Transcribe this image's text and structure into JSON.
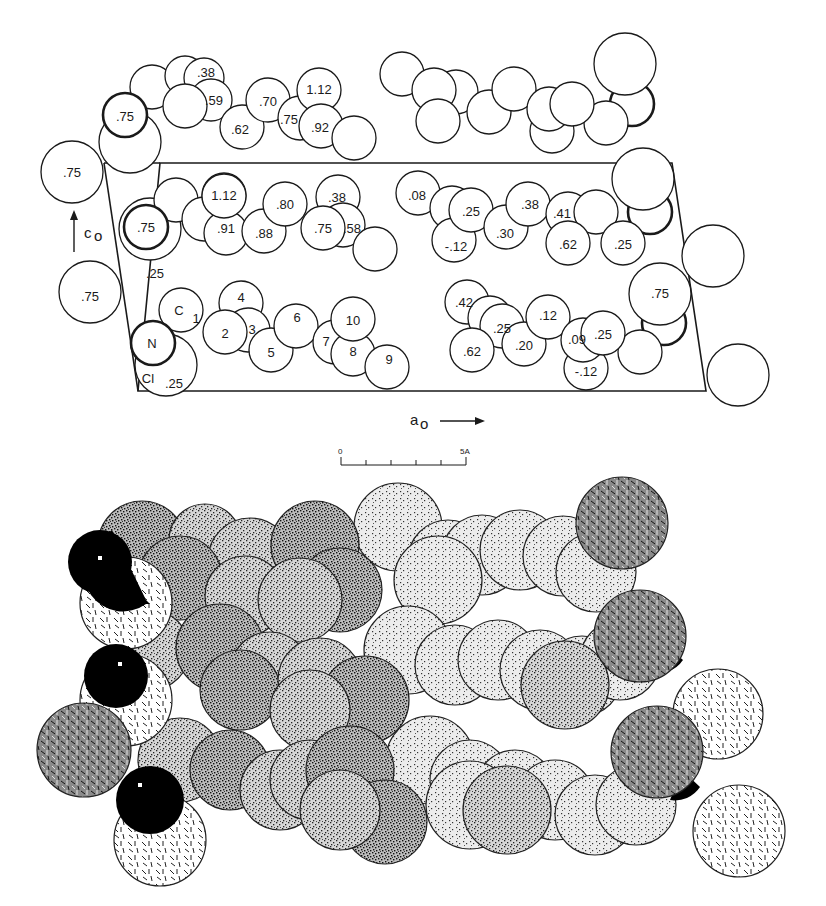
{
  "figure": {
    "top_panel": {
      "description": "Crystal packing projection along b, unit cell outlined",
      "axis_labels": {
        "c_axis": "c",
        "c_sub": "o",
        "a_axis": "a",
        "a_sub": "o"
      },
      "scale_bar": {
        "start_label": "0",
        "end_label": "5A",
        "ticks": 5
      },
      "atom_labels": {
        "outside_left_1": ".75",
        "outside_left_2": ".75",
        "row_top": [
          ".75",
          ".38",
          ".59",
          ".62",
          ".70",
          "1.12",
          ".75",
          ".92"
        ],
        "row_mid_left": [
          ".75",
          ".25",
          "1.12",
          ".91",
          ".88",
          ".80",
          ".38",
          ".75",
          ".58"
        ],
        "row_mid_right": [
          ".08",
          ".25",
          "-.12",
          ".30",
          ".38",
          ".41",
          ".62",
          ".25"
        ],
        "row_bottom_left": [
          "N",
          "Cl",
          ".25",
          "C",
          "1",
          "2",
          "3",
          "4",
          "5",
          "6",
          "7",
          "8",
          "9",
          "10"
        ],
        "row_bottom_right": [
          ".42",
          ".25",
          ".62",
          ".20",
          ".12",
          ".09",
          "-.12",
          ".25",
          ".75"
        ]
      }
    },
    "bottom_panel": {
      "description": "Space-filling model of molecular packing",
      "shading_legend": [
        {
          "pattern": "solid-black",
          "meaning": "N atom"
        },
        {
          "pattern": "dashes",
          "meaning": "Cl atom"
        },
        {
          "pattern": "dense-stipple",
          "meaning": "near C atoms"
        },
        {
          "pattern": "light-stipple",
          "meaning": "far C atoms"
        }
      ]
    }
  }
}
